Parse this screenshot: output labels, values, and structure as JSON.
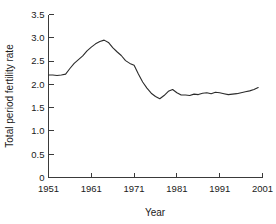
{
  "chart_data": {
    "type": "line",
    "title": "",
    "xlabel": "Year",
    "ylabel": "Total period fertility rate",
    "xlim": [
      1951,
      2001
    ],
    "ylim": [
      0,
      3.5
    ],
    "grid": false,
    "legend": null,
    "xticks": [
      1951,
      1961,
      1971,
      1981,
      1991,
      2001
    ],
    "xtick_labels": [
      "1951",
      "1961",
      "1971",
      "1981",
      "1991",
      "2001"
    ],
    "yticks": [
      0,
      0.5,
      1.0,
      1.5,
      2.0,
      2.5,
      3.0,
      3.5
    ],
    "ytick_labels": [
      "0",
      "0.5",
      "1.0",
      "1.5",
      "2.0",
      "2.5",
      "3.0",
      "3.5"
    ],
    "series": [
      {
        "name": "Total period fertility rate",
        "color": "#2b2b2b",
        "x": [
          1951,
          1952,
          1953,
          1954,
          1955,
          1956,
          1957,
          1958,
          1959,
          1960,
          1961,
          1962,
          1963,
          1964,
          1965,
          1966,
          1967,
          1968,
          1969,
          1970,
          1971,
          1972,
          1973,
          1974,
          1975,
          1976,
          1977,
          1978,
          1979,
          1980,
          1981,
          1982,
          1983,
          1984,
          1985,
          1986,
          1987,
          1988,
          1989,
          1990,
          1991,
          1992,
          1993,
          1994,
          1995,
          1996,
          1997,
          1998,
          1999,
          2000
        ],
        "values": [
          2.2,
          2.2,
          2.19,
          2.2,
          2.22,
          2.34,
          2.45,
          2.53,
          2.61,
          2.72,
          2.8,
          2.87,
          2.92,
          2.95,
          2.9,
          2.79,
          2.7,
          2.62,
          2.51,
          2.45,
          2.41,
          2.22,
          2.05,
          1.92,
          1.81,
          1.74,
          1.69,
          1.76,
          1.85,
          1.89,
          1.82,
          1.77,
          1.77,
          1.76,
          1.79,
          1.78,
          1.81,
          1.82,
          1.8,
          1.83,
          1.82,
          1.8,
          1.78,
          1.79,
          1.8,
          1.82,
          1.84,
          1.86,
          1.89,
          1.93
        ]
      }
    ]
  },
  "axes": {
    "y_title": "Total period fertility rate",
    "x_title": "Year"
  }
}
